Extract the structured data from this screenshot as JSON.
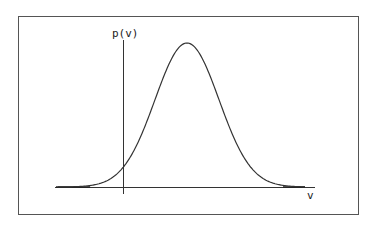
{
  "chart_data": {
    "type": "line",
    "title": "",
    "xlabel": "v",
    "ylabel": "p(v)",
    "grid": false,
    "legend": null,
    "series": [
      {
        "name": "p(v)",
        "shape": "gaussian",
        "peak_x_relative": 0.5,
        "x": [
          -4,
          -3,
          -2,
          -1,
          0,
          1,
          2,
          3,
          4
        ],
        "values": [
          0.0003,
          0.011,
          0.135,
          0.607,
          1.0,
          0.607,
          0.135,
          0.011,
          0.0003
        ]
      }
    ],
    "axes": {
      "y_axis_position": "x = mean - 2 sigma",
      "ticks": "none"
    }
  },
  "labels": {
    "y_axis": "p(v)",
    "x_axis": "v"
  },
  "style": {
    "line_color": "#333333",
    "frame_color": "#555555",
    "background": "#ffffff"
  },
  "geometry": {
    "frame": {
      "x": 18,
      "y": 16,
      "w": 340,
      "h": 198
    },
    "x_axis": {
      "x1": 55,
      "x2": 315,
      "y": 187
    },
    "y_axis": {
      "x": 123,
      "y1": 40,
      "y2": 194
    },
    "curve": {
      "mu": 187,
      "sigma": 32,
      "baseline": 187,
      "amplitude": 144,
      "x_start": 58,
      "x_end": 305
    }
  }
}
